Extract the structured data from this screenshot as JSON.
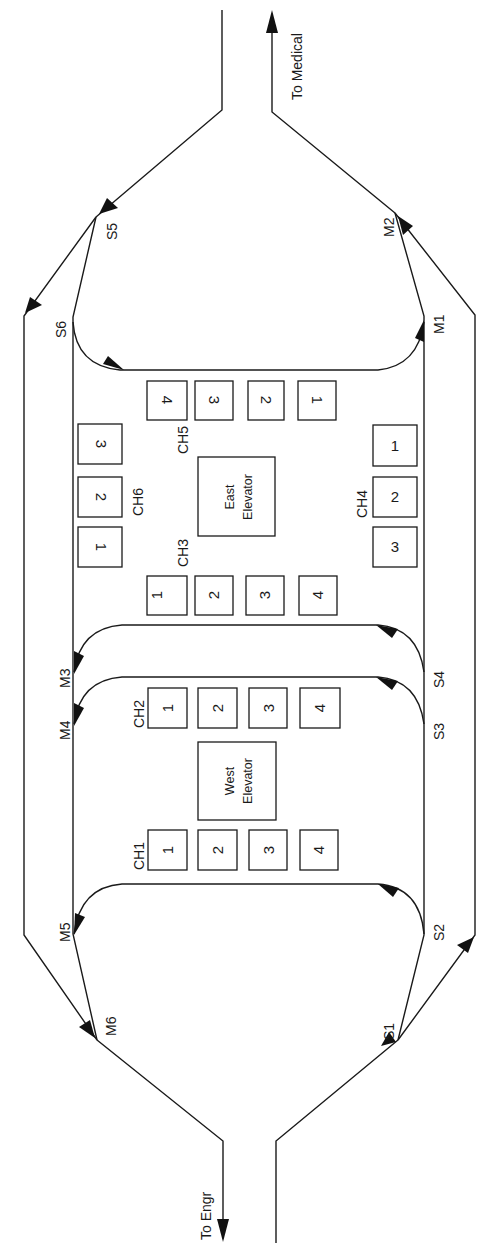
{
  "exits": {
    "top": {
      "label": "To Medical"
    },
    "bottom": {
      "label": "To Engr"
    }
  },
  "nodes": {
    "S1": "S1",
    "S2": "S2",
    "S3": "S3",
    "S4": "S4",
    "S5": "S5",
    "S6": "S6",
    "M1": "M1",
    "M2": "M2",
    "M3": "M3",
    "M4": "M4",
    "M5": "M5",
    "M6": "M6"
  },
  "elevators": {
    "east": {
      "line1": "East",
      "line2": "Elevator"
    },
    "west": {
      "line1": "West",
      "line2": "Elevator"
    }
  },
  "call_groups": [
    {
      "id": "CH1",
      "label": "CH1",
      "buttons": [
        "1",
        "2",
        "3",
        "4"
      ]
    },
    {
      "id": "CH2",
      "label": "CH2",
      "buttons": [
        "1",
        "2",
        "3",
        "4"
      ]
    },
    {
      "id": "CH3",
      "label": "CH3",
      "buttons": [
        "1",
        "2",
        "3",
        "4"
      ]
    },
    {
      "id": "CH4",
      "label": "CH4",
      "buttons": [
        "1",
        "2",
        "3"
      ]
    },
    {
      "id": "CH5",
      "label": "CH5",
      "buttons": [
        "1",
        "2",
        "3",
        "4"
      ]
    },
    {
      "id": "CH6",
      "label": "CH6",
      "buttons": [
        "1",
        "2",
        "3"
      ]
    }
  ],
  "colors": {
    "ink": "#1a1a1a",
    "background": "#ffffff"
  }
}
